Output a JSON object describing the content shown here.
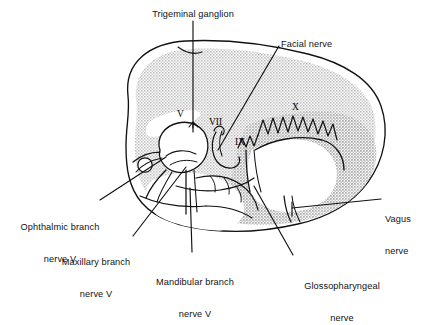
{
  "figure": {
    "type": "anatomical-line-diagram",
    "width": 424,
    "height": 296,
    "background_color": "#ffffff",
    "ink_color": "#111111",
    "fill_gray": "#d9d9d9",
    "fill_gray_dark": "#c9c9c9",
    "fill_white": "#ffffff"
  },
  "callouts": {
    "trigeminal_ganglion": {
      "text": "Trigeminal ganglion",
      "lines": [
        "Trigeminal ganglion"
      ],
      "align": "center",
      "x": 193,
      "y": 10,
      "leader": "vertical-down"
    },
    "facial_nerve": {
      "text": "Facial nerve",
      "lines": [
        "Facial nerve"
      ],
      "align": "left",
      "x": 282,
      "y": 40,
      "leader": "diagonal-down-left"
    },
    "ophthalmic_branch": {
      "text": "Ophthalmic branch nerve V",
      "lines": [
        "Ophthalmic branch",
        "nerve V"
      ],
      "align": "center",
      "x": 11,
      "y": 202,
      "leader": "diagonal-up-right"
    },
    "maxillary_branch": {
      "text": "Maxillary branch nerve V",
      "lines": [
        "Maxillary branch",
        "nerve V"
      ],
      "align": "center",
      "x": 48,
      "y": 237,
      "leader": "diagonal-up-right"
    },
    "mandibular_branch": {
      "text": "Mandibular branch nerve V",
      "lines": [
        "Mandibular branch",
        "nerve V"
      ],
      "align": "center",
      "x": 162,
      "y": 258,
      "leader": "vertical-up"
    },
    "glossopharyngeal_nerve": {
      "text": "Glossopharyngeal nerve",
      "lines": [
        "Glossopharyngeal",
        "nerve"
      ],
      "align": "center",
      "x": 297,
      "y": 261,
      "leader": "diagonal-up-left"
    },
    "vagus_nerve": {
      "text": "Vagus nerve",
      "lines": [
        "Vagus",
        "nerve"
      ],
      "align": "left",
      "x": 385,
      "y": 194,
      "leader": "horizontal-left"
    }
  },
  "nerve_numerals": [
    {
      "id": "numeral-v",
      "label": "V",
      "x": 180,
      "y": 110,
      "refers_to": "Trigeminal nerve (CN V)"
    },
    {
      "id": "numeral-vii",
      "label": "VII",
      "x": 212,
      "y": 118,
      "refers_to": "Facial nerve (CN VII)"
    },
    {
      "id": "numeral-ix",
      "label": "IX",
      "x": 238,
      "y": 138,
      "refers_to": "Glossopharyngeal nerve (CN IX)"
    },
    {
      "id": "numeral-x",
      "label": "X",
      "x": 294,
      "y": 103,
      "refers_to": "Vagus nerve (CN X)"
    }
  ]
}
